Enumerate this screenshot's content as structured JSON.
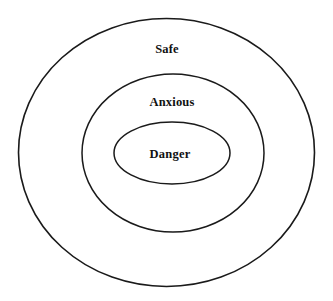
{
  "diagram": {
    "type": "concentric-ellipses",
    "title": "",
    "background_color": "#ffffff",
    "stroke_color": "#1a1a1a",
    "fill_color": "#ffffff",
    "text_color": "#111111",
    "zones": [
      {
        "id": "outer",
        "label": "Safe",
        "level": 1,
        "center_x": 166.5,
        "center_y": 152.5,
        "radius_x": 148,
        "radius_y": 134,
        "stroke_width": 1.6,
        "label_x": 167,
        "label_y": 50.5,
        "font_size": 12.5
      },
      {
        "id": "middle",
        "label": "Anxious",
        "level": 2,
        "center_x": 173,
        "center_y": 153,
        "radius_x": 91,
        "radius_y": 79,
        "stroke_width": 1.5,
        "label_x": 172,
        "label_y": 103.5,
        "font_size": 12.5
      },
      {
        "id": "inner",
        "label": "Danger",
        "level": 3,
        "center_x": 172,
        "center_y": 153,
        "radius_x": 58,
        "radius_y": 31,
        "stroke_width": 1.5,
        "label_x": 170,
        "label_y": 155.5,
        "font_size": 12.5
      }
    ]
  }
}
